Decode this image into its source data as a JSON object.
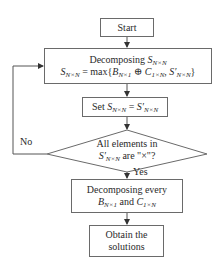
{
  "diagram": {
    "type": "flowchart",
    "nodes": {
      "start": {
        "label": "Start"
      },
      "decompose": {
        "line1_prefix": "Decomposing ",
        "line1_var": "S",
        "line1_sub": "N×N",
        "line2_lhs": "S",
        "line2_lhs_sub": "N×N",
        "line2_eq": " = max{",
        "line2_b": "B",
        "line2_b_sub": "N×1",
        "line2_op": " ⊕ ",
        "line2_c": "C",
        "line2_c_sub": "1×N",
        "line2_comma": ", ",
        "line2_s": "S′",
        "line2_s_sub": "N×N",
        "line2_close": "}"
      },
      "set": {
        "prefix": "Set ",
        "lhs": "S",
        "lhs_sub": "N×N",
        "eq": " = ",
        "rhs": "S′",
        "rhs_sub": "N×N"
      },
      "decision": {
        "line1": "All elements in",
        "var": "S′",
        "var_sub": "N×N",
        "suffix": " are \"×\"?"
      },
      "decompose_every": {
        "line1": "Decomposing every",
        "b": "B",
        "b_sub": "N×1",
        "and": " and ",
        "c": "C",
        "c_sub": "1×N"
      },
      "obtain": {
        "line1": "Obtain the",
        "line2": "solutions"
      }
    },
    "edge_labels": {
      "no": "No",
      "yes": "Yes"
    },
    "colors": {
      "stroke": "#6a6a6a",
      "text": "#2a2a2a",
      "background": "#ffffff"
    }
  }
}
